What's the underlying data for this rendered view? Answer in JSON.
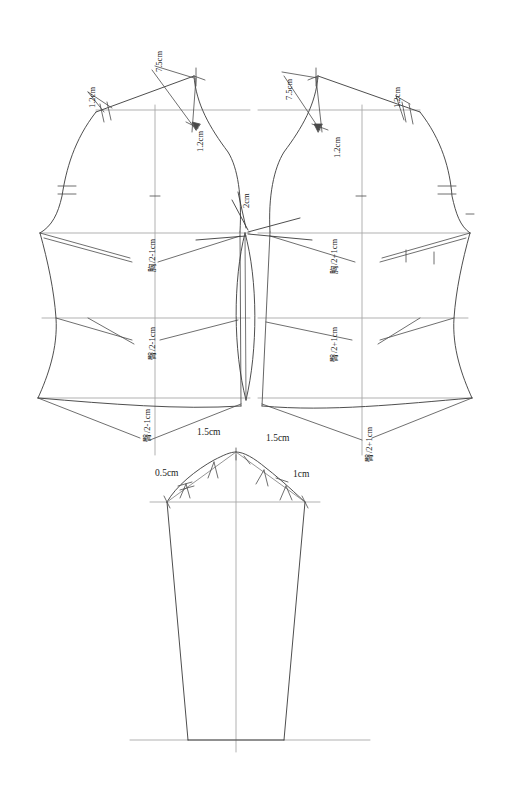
{
  "document": {
    "title": "Bodice and Sleeve Pattern Draft",
    "type": "technical-sewing-pattern",
    "units": "cm",
    "line_color": "#3a3a3a",
    "guide_color": "#9a9a9a",
    "background": "#ffffff"
  },
  "annotations": {
    "back_shoulder_drop": "1.2cm",
    "back_neck_width": "7.5cm",
    "back_neck_drop": "1.2cm",
    "front_neck_width": "7.5cm",
    "front_neck_drop": "1.2cm",
    "front_shoulder_drop": "1.2cm",
    "center_dart_intake": "2cm",
    "back_chest_formula": "胸/2-1cm",
    "back_hip_formula": "臀/2-1cm",
    "back_hem_formula": "臀/2-1cm",
    "front_chest_formula": "胸/2+1cm",
    "front_hip_formula": "臀/2+1cm",
    "front_hem_formula": "臀/2+1cm",
    "sleeve_cap_left_upper": "1.5cm",
    "sleeve_cap_right_upper": "1.5cm",
    "sleeve_cap_left_lower": "0.5cm",
    "sleeve_cap_right_lower": "1cm"
  },
  "formulas": {
    "chest_minus": {
      "symbol": "胸",
      "numerator": "胸",
      "denominator": "2",
      "offset": "-1cm",
      "full": "胸/2-1cm"
    },
    "chest_plus": {
      "symbol": "胸",
      "numerator": "胸",
      "denominator": "2",
      "offset": "+1cm",
      "full": "胸/2+1cm"
    },
    "hip_minus": {
      "symbol": "臀",
      "numerator": "臀",
      "denominator": "2",
      "offset": "-1cm",
      "full": "臀/2-1cm"
    },
    "hip_plus": {
      "symbol": "臀",
      "numerator": "臀",
      "denominator": "2",
      "offset": "+1cm",
      "full": "臀/2+1cm"
    }
  },
  "pieces": [
    {
      "name": "back-bodice",
      "position": "left",
      "label": "Back bodice half"
    },
    {
      "name": "front-bodice",
      "position": "right",
      "label": "Front bodice half"
    },
    {
      "name": "sleeve",
      "position": "bottom-center",
      "label": "Two-piece tapered sleeve"
    }
  ],
  "guide_lines": [
    {
      "name": "chest-line",
      "y": 233
    },
    {
      "name": "waist-line",
      "y": 318
    },
    {
      "name": "shoulder-line",
      "y": 110
    },
    {
      "name": "hem-line",
      "y": 398
    },
    {
      "name": "sleeve-biceps-line",
      "y": 502
    },
    {
      "name": "sleeve-hem-line",
      "y": 740
    }
  ]
}
